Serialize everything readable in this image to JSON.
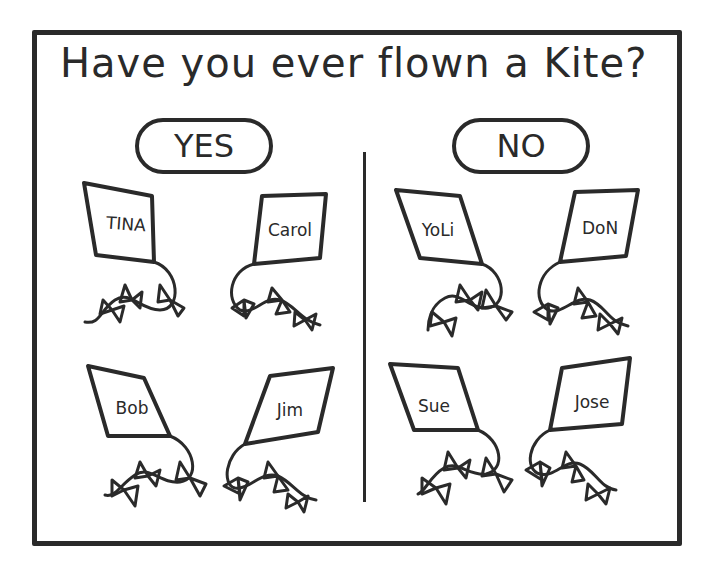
{
  "title": "Have you ever flown a Kite?",
  "columns": [
    {
      "label": "YES",
      "kites": [
        {
          "name": "TINA"
        },
        {
          "name": "Carol"
        },
        {
          "name": "Bob"
        },
        {
          "name": "Jim"
        }
      ]
    },
    {
      "label": "NO",
      "kites": [
        {
          "name": "YoLi"
        },
        {
          "name": "DoN"
        },
        {
          "name": "Sue"
        },
        {
          "name": "Jose"
        }
      ]
    }
  ],
  "colors": {
    "ink": "#2a2a2a",
    "background": "#ffffff"
  }
}
